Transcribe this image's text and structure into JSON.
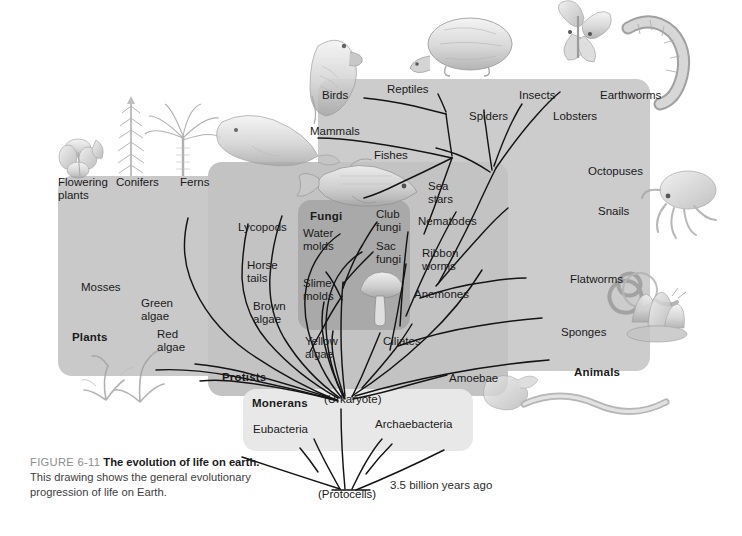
{
  "figure": {
    "number": "FIGURE 6-11",
    "title": "The evolution of life on earth.",
    "body": "This drawing shows the general evolutionary progression of life on Earth."
  },
  "kingdoms": [
    {
      "id": "plants",
      "label": "Plants"
    },
    {
      "id": "protists",
      "label": "Protists"
    },
    {
      "id": "fungi",
      "label": "Fungi"
    },
    {
      "id": "animals",
      "label": "Animals"
    },
    {
      "id": "monerans",
      "label": "Monerans"
    }
  ],
  "nodes": {
    "urkaryote": "(Urkaryote)",
    "protocells": "(Protocells)"
  },
  "time_annotation": "3.5 billion years ago",
  "branches": {
    "plants": [
      {
        "id": "flowering-plants",
        "label": "Flowering\nplants"
      },
      {
        "id": "conifers",
        "label": "Conifers"
      },
      {
        "id": "ferns",
        "label": "Ferns"
      },
      {
        "id": "lycopods",
        "label": "Lycopods"
      },
      {
        "id": "horse-tails",
        "label": "Horse\ntails"
      },
      {
        "id": "mosses",
        "label": "Mosses"
      },
      {
        "id": "green-algae",
        "label": "Green\nalgae"
      },
      {
        "id": "red-algae",
        "label": "Red\nalgae"
      }
    ],
    "protists": [
      {
        "id": "brown-algae",
        "label": "Brown\nalgae"
      },
      {
        "id": "yellow-algae",
        "label": "Yellow\nalgae"
      },
      {
        "id": "ciliates",
        "label": "Ciliates"
      },
      {
        "id": "amoebae",
        "label": "Amoebae"
      }
    ],
    "fungi": [
      {
        "id": "water-molds",
        "label": "Water\nmolds"
      },
      {
        "id": "club-fungi",
        "label": "Club\nfungi"
      },
      {
        "id": "sac-fungi",
        "label": "Sac\nfungi"
      },
      {
        "id": "slime-molds",
        "label": "Slime\nmolds"
      }
    ],
    "animals": [
      {
        "id": "birds",
        "label": "Birds"
      },
      {
        "id": "reptiles",
        "label": "Reptiles"
      },
      {
        "id": "mammals",
        "label": "Mammals"
      },
      {
        "id": "fishes",
        "label": "Fishes"
      },
      {
        "id": "sea-stars",
        "label": "Sea\nstars"
      },
      {
        "id": "spiders",
        "label": "Spiders"
      },
      {
        "id": "insects",
        "label": "Insects"
      },
      {
        "id": "lobsters",
        "label": "Lobsters"
      },
      {
        "id": "earthworms",
        "label": "Earthworms"
      },
      {
        "id": "octopuses",
        "label": "Octopuses"
      },
      {
        "id": "snails",
        "label": "Snails"
      },
      {
        "id": "nematodes",
        "label": "Nematodes"
      },
      {
        "id": "ribbon-worms",
        "label": "Ribbon\nworms"
      },
      {
        "id": "flatworms",
        "label": "Flatworms"
      },
      {
        "id": "anemones",
        "label": "Anemones"
      },
      {
        "id": "sponges",
        "label": "Sponges"
      }
    ],
    "monerans": [
      {
        "id": "eubacteria",
        "label": "Eubacteria"
      },
      {
        "id": "archaebacteria",
        "label": "Archaebacteria"
      }
    ]
  },
  "illustrations": [
    {
      "id": "flower",
      "name": "flower-illustration"
    },
    {
      "id": "conifer",
      "name": "conifer-illustration"
    },
    {
      "id": "fern",
      "name": "fern-illustration"
    },
    {
      "id": "parrot",
      "name": "bird-illustration"
    },
    {
      "id": "seal",
      "name": "mammal-illustration"
    },
    {
      "id": "fish",
      "name": "fish-illustration"
    },
    {
      "id": "turtle",
      "name": "reptile-illustration"
    },
    {
      "id": "butterfly",
      "name": "insect-illustration"
    },
    {
      "id": "earthworm",
      "name": "earthworm-illustration"
    },
    {
      "id": "octopus",
      "name": "octopus-illustration"
    },
    {
      "id": "snail",
      "name": "snail-illustration"
    },
    {
      "id": "flatworm",
      "name": "flatworm-illustration"
    },
    {
      "id": "sponge",
      "name": "sponge-illustration"
    },
    {
      "id": "mushroom",
      "name": "mushroom-illustration"
    },
    {
      "id": "seaweed",
      "name": "algae-illustration"
    },
    {
      "id": "amoeba",
      "name": "amoeba-illustration"
    }
  ],
  "colors": {
    "panel_plants": "#c9c9c9",
    "panel_protists": "#c3c3c3",
    "panel_animals": "#cccccc",
    "panel_fungi": "#a9a9a9",
    "panel_monerans": "#e8e8e8",
    "branch_line": "#141414",
    "text": "#1a1a1a",
    "caption_grey": "#8e8e8e"
  }
}
